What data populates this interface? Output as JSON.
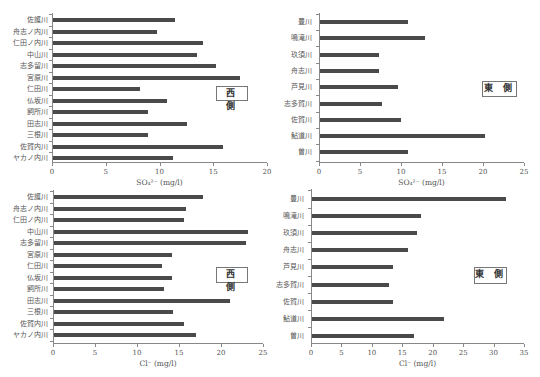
{
  "chart_data": [
    {
      "id": "so4-west",
      "type": "bar",
      "orientation": "horizontal",
      "title": "",
      "legend_label": "西 側",
      "xlabel": "SO₄²⁻ (mg/l)",
      "ylabel": "",
      "xlim": [
        0,
        20
      ],
      "xticks": [
        0,
        5,
        10,
        15,
        20
      ],
      "grid": false,
      "categories": [
        "佐護川",
        "舟志ノ内川",
        "仁田ノ内川",
        "中山川",
        "志多留川",
        "宮原川",
        "仁田川",
        "仏坂川",
        "飼所川",
        "田志川",
        "三根川",
        "佐賀内川",
        "ヤカノ内川"
      ],
      "values": [
        11.4,
        9.8,
        14.0,
        13.5,
        15.3,
        17.5,
        8.2,
        10.7,
        8.9,
        12.6,
        8.9,
        15.9,
        11.3
      ]
    },
    {
      "id": "so4-east",
      "type": "bar",
      "orientation": "horizontal",
      "title": "",
      "legend_label": "東 側",
      "xlabel": "SO₄²⁻ (mg/l)",
      "ylabel": "",
      "xlim": [
        0,
        25
      ],
      "xticks": [
        0,
        5,
        10,
        15,
        20,
        25
      ],
      "grid": false,
      "categories": [
        "豊川",
        "鳴滝川",
        "玖須川",
        "舟志川",
        "芦見川",
        "志多賀川",
        "佐賀川",
        "鮎道川",
        "曽川"
      ],
      "values": [
        10.9,
        12.9,
        7.3,
        7.3,
        9.6,
        7.7,
        10.0,
        20.2,
        10.9
      ]
    },
    {
      "id": "cl-west",
      "type": "bar",
      "orientation": "horizontal",
      "title": "",
      "legend_label": "西 側",
      "xlabel": "Cl⁻ (mg/l)",
      "ylabel": "",
      "xlim": [
        0,
        25
      ],
      "xticks": [
        0,
        5,
        10,
        15,
        20,
        25
      ],
      "grid": false,
      "categories": [
        "佐護川",
        "舟志ノ内川",
        "仁田ノ内川",
        "中山川",
        "志多留川",
        "宮原川",
        "仁田川",
        "仏坂川",
        "飼所川",
        "田志川",
        "三根川",
        "佐賀内川",
        "ヤカノ内川"
      ],
      "values": [
        17.9,
        15.8,
        15.6,
        23.2,
        23.0,
        14.2,
        13.0,
        14.2,
        13.2,
        21.1,
        14.3,
        15.6,
        17.0
      ]
    },
    {
      "id": "cl-east",
      "type": "bar",
      "orientation": "horizontal",
      "title": "",
      "legend_label": "東 側",
      "xlabel": "Cl⁻ (mg/l)",
      "ylabel": "",
      "xlim": [
        0,
        35
      ],
      "xticks": [
        0,
        5,
        10,
        15,
        20,
        25,
        30,
        35
      ],
      "grid": false,
      "categories": [
        "豊川",
        "鳴滝川",
        "玖須川",
        "舟志川",
        "芦見川",
        "志多賀川",
        "佐賀川",
        "鮎道川",
        "曽川"
      ],
      "values": [
        32.0,
        18.1,
        17.4,
        15.9,
        13.5,
        12.8,
        13.5,
        21.8,
        16.9
      ]
    }
  ],
  "colors": {
    "bar": "#4a4a4a",
    "axis": "#888888",
    "text": "#555555"
  }
}
